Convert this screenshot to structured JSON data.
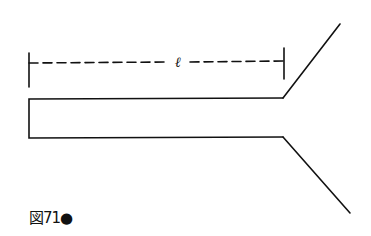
{
  "diagram": {
    "dimension_label": "ℓ",
    "caption": "図71●",
    "stroke_color": "#111111",
    "background": "#ffffff"
  }
}
